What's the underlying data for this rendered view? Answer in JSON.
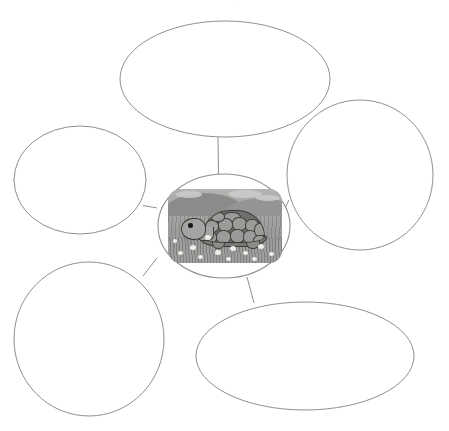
{
  "worksheet": {
    "type": "concept-map-graphic-organizer",
    "title_mark": "...",
    "background_color": "#ffffff",
    "outline_color": "#8d8f92",
    "center": {
      "label": "",
      "image": {
        "name": "turtle-photo",
        "subject": "turtle",
        "alt_text": "Turtle on grassy ground",
        "colors": {
          "sky": "#b4b4b2",
          "ground": "#a3a3a1",
          "shell": "#6f6f6d",
          "shell_outline": "#3b3b39",
          "head": "#a4a4a2",
          "eye": "#151513"
        }
      }
    },
    "bubbles": [
      {
        "id": "bubble-top",
        "position": "top",
        "text": ""
      },
      {
        "id": "bubble-upper-left",
        "position": "upper-left",
        "text": ""
      },
      {
        "id": "bubble-right",
        "position": "right",
        "text": ""
      },
      {
        "id": "bubble-lower-left",
        "position": "lower-left",
        "text": ""
      },
      {
        "id": "bubble-bottom-right",
        "position": "bottom-right",
        "text": ""
      }
    ],
    "connectors": [
      {
        "id": "connector-top",
        "from": "center",
        "to": "bubble-top"
      },
      {
        "id": "connector-upper-left",
        "from": "center",
        "to": "bubble-upper-left"
      },
      {
        "id": "connector-right",
        "from": "center",
        "to": "bubble-right"
      },
      {
        "id": "connector-lower-left",
        "from": "center",
        "to": "bubble-lower-left"
      },
      {
        "id": "connector-bottom-right",
        "from": "center",
        "to": "bubble-bottom-right"
      }
    ]
  }
}
